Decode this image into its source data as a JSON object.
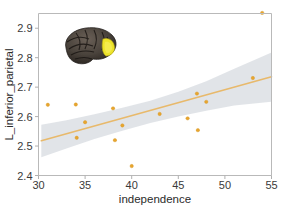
{
  "chart_data": {
    "type": "scatter",
    "title": "",
    "xlabel": "independence",
    "ylabel": "L_inferior_parietal",
    "xlim": [
      30,
      55
    ],
    "ylim": [
      2.4,
      2.95
    ],
    "xticks": [
      30,
      35,
      40,
      45,
      50,
      55
    ],
    "xticklabels": [
      "30",
      "35",
      "40",
      "45",
      "50",
      "55"
    ],
    "yticks": [
      2.4,
      2.5,
      2.6,
      2.7,
      2.8,
      2.9
    ],
    "yticklabels": [
      "2.4",
      "2.5",
      "2.6",
      "2.7",
      "2.8",
      "2.9"
    ],
    "grid": false,
    "legend": "none",
    "points": [
      {
        "x": 31.0,
        "y": 2.64
      },
      {
        "x": 34.0,
        "y": 2.641
      },
      {
        "x": 34.1,
        "y": 2.528
      },
      {
        "x": 35.0,
        "y": 2.581
      },
      {
        "x": 38.0,
        "y": 2.628
      },
      {
        "x": 38.2,
        "y": 2.52
      },
      {
        "x": 39.0,
        "y": 2.57
      },
      {
        "x": 40.0,
        "y": 2.432
      },
      {
        "x": 43.0,
        "y": 2.609
      },
      {
        "x": 46.0,
        "y": 2.594
      },
      {
        "x": 47.0,
        "y": 2.678
      },
      {
        "x": 47.1,
        "y": 2.554
      },
      {
        "x": 48.0,
        "y": 2.65
      },
      {
        "x": 53.0,
        "y": 2.731
      },
      {
        "x": 54.0,
        "y": 2.952
      }
    ],
    "fit_line": {
      "name": "linear regression fit",
      "x": [
        30.3,
        55.0
      ],
      "y": [
        2.518,
        2.735
      ],
      "color": "#e8b96b"
    },
    "confidence_band": {
      "name": "95% confidence interval",
      "x": [
        30.3,
        33.0,
        36.0,
        39.0,
        42.0,
        45.0,
        48.0,
        51.0,
        55.0
      ],
      "upper": [
        2.572,
        2.588,
        2.608,
        2.63,
        2.654,
        2.684,
        2.72,
        2.762,
        2.818
      ],
      "lower": [
        2.462,
        2.492,
        2.524,
        2.552,
        2.578,
        2.6,
        2.62,
        2.638,
        2.65
      ],
      "color": "#c9ced6"
    },
    "annotations": [
      {
        "name": "brain-inset",
        "description": "lateral brain surface render with inferior parietal region highlighted",
        "highlight_color": "#ede32a",
        "surface_color": "#4a433c"
      }
    ],
    "colors": {
      "point": "#e8a52e",
      "line": "#e8b96b",
      "band": "#c9ced6",
      "frame": "#b9b9b9",
      "text": "#2b2b2b",
      "background": "#ffffff"
    }
  }
}
